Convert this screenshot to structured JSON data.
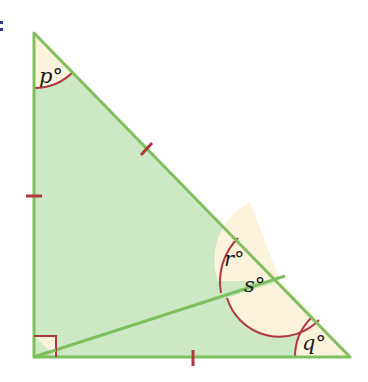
{
  "diagram": {
    "type": "right-triangle-with-cevian",
    "colors": {
      "fill": "#cde8c4",
      "stroke": "#7fbf5e",
      "angle_fill": "#fdf2dc",
      "arc": "#b0373f",
      "tick": "#b0373f",
      "corner_fragment": "#2b3a8c"
    },
    "angle_labels": {
      "p": "p°",
      "q": "q°",
      "r": "r°",
      "s": "s°"
    },
    "right_angle_marker": true,
    "equal_length_ticks": 3
  }
}
